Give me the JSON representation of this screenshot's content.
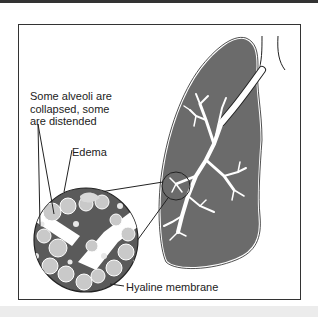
{
  "figure": {
    "labels": {
      "alveoli": "Some alveoli are\ncollapsed, some\nare distended",
      "edema": "Edema",
      "hyaline": "Hyaline membrane"
    },
    "colors": {
      "lung_fill": "#6b6b6b",
      "outline": "#222222",
      "airway": "#ffffff",
      "frame_border": "#333333",
      "bottom_band": "#ececec"
    }
  }
}
